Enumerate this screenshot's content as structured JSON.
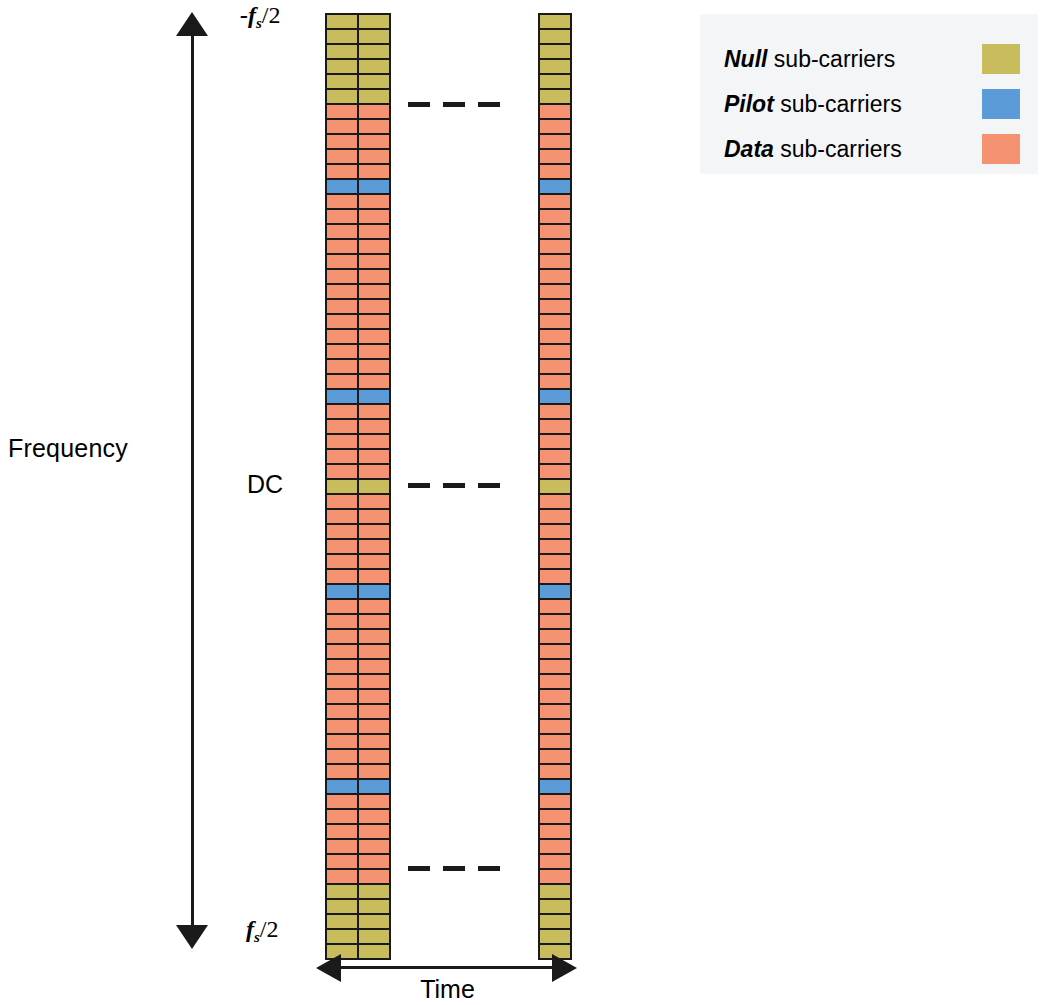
{
  "figure": {
    "y_axis_label": "Frequency",
    "x_axis_label": "Time",
    "top_tick_prefix": "-",
    "top_tick_symbol": "f",
    "top_tick_subscript": "s",
    "top_tick_suffix": "/2",
    "bottom_tick_prefix": "",
    "bottom_tick_symbol": "f",
    "bottom_tick_subscript": "s",
    "bottom_tick_suffix": "/2",
    "dc_label": "DC",
    "ellipsis_glyph": "dash"
  },
  "legend": {
    "items": [
      {
        "emphasis": "Null",
        "label": " sub-carriers",
        "color": "#c8bc5c",
        "swatch_name": "null-swatch"
      },
      {
        "emphasis": "Pilot",
        "label": " sub-carriers",
        "color": "#5b9bd8",
        "swatch_name": "pilot-swatch"
      },
      {
        "emphasis": "Data",
        "label": " sub-carriers",
        "color": "#f59271",
        "swatch_name": "data-swatch"
      }
    ]
  },
  "chart_data": {
    "type": "heatmap",
    "xlabel": "Time",
    "ylabel": "Frequency",
    "ylim": [
      "-fs/2",
      "fs/2"
    ],
    "grid": false,
    "legend_position": "top-right",
    "categories": [
      "Null",
      "Pilot",
      "Data"
    ],
    "category_colors": {
      "Null": "#c8bc5c",
      "Pilot": "#5b9bd8",
      "Data": "#f59271"
    },
    "n_subcarriers": 62,
    "n_symbols_shown": 3,
    "symbol_groups": [
      {
        "name": "first-symbols",
        "columns": 2
      },
      {
        "name": "last-symbol",
        "columns": 1
      }
    ],
    "subcarrier_types": [
      "Null",
      "Null",
      "Null",
      "Null",
      "Null",
      "Null",
      "Data",
      "Data",
      "Data",
      "Data",
      "Data",
      "Pilot",
      "Data",
      "Data",
      "Data",
      "Data",
      "Data",
      "Data",
      "Data",
      "Data",
      "Data",
      "Data",
      "Data",
      "Data",
      "Data",
      "Pilot",
      "Data",
      "Data",
      "Data",
      "Data",
      "Data",
      "Null",
      "Data",
      "Data",
      "Data",
      "Data",
      "Data",
      "Data",
      "Pilot",
      "Data",
      "Data",
      "Data",
      "Data",
      "Data",
      "Data",
      "Data",
      "Data",
      "Data",
      "Data",
      "Data",
      "Data",
      "Pilot",
      "Data",
      "Data",
      "Data",
      "Data",
      "Data",
      "Data",
      "Null",
      "Null",
      "Null",
      "Null",
      "Null"
    ],
    "annotations": [
      {
        "text": "-fs/2",
        "position": "top-left-of-grid"
      },
      {
        "text": "DC",
        "position": "middle-left-of-grid"
      },
      {
        "text": "fs/2",
        "position": "bottom-left-of-grid"
      }
    ]
  }
}
